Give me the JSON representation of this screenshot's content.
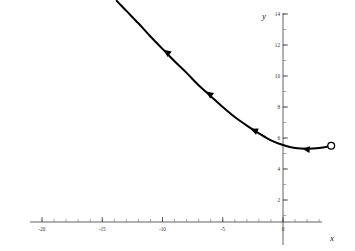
{
  "figure": {
    "background_color": "#ffffff",
    "curve_color": "#000000",
    "axis_color": "#3a3a3a",
    "width": 355,
    "height": 251
  },
  "axes": {
    "x_axis_label": "x",
    "y_axis_label": "y",
    "x_ticks": [
      {
        "value": -20,
        "label": "-20"
      },
      {
        "value": -15,
        "label": "-15"
      },
      {
        "value": -10,
        "label": "-10"
      },
      {
        "value": -5,
        "label": "-5"
      },
      {
        "value": 0,
        "label": "0"
      }
    ],
    "y_ticks": [
      {
        "value": 14,
        "label": "14"
      },
      {
        "value": 12,
        "label": "12"
      },
      {
        "value": 10,
        "label": "10"
      },
      {
        "value": 8,
        "label": "8"
      },
      {
        "value": 6,
        "label": "6"
      },
      {
        "value": 4,
        "label": "4"
      },
      {
        "value": 2,
        "label": "2"
      }
    ],
    "x_minor_step": 1,
    "y_minor_step": 1
  },
  "chart_data": {
    "type": "line",
    "title": "",
    "subtitle": "",
    "xlabel": "x",
    "ylabel": "y",
    "xlim": [
      -23.5,
      6
    ],
    "ylim": [
      0,
      15.3
    ],
    "grid": false,
    "legend": null,
    "series": [
      {
        "name": "solution curve",
        "color": "#000000",
        "x": [
          -13.8,
          -13.0,
          -12.0,
          -11.0,
          -10.0,
          -9.0,
          -8.0,
          -7.0,
          -6.0,
          -5.0,
          -4.0,
          -3.0,
          -2.0,
          -1.0,
          0.0,
          1.0,
          2.0,
          3.0,
          4.0
        ],
        "y": [
          14.85,
          14.2,
          13.4,
          12.55,
          11.75,
          10.95,
          10.2,
          9.4,
          8.7,
          8.0,
          7.35,
          6.8,
          6.3,
          5.85,
          5.55,
          5.35,
          5.3,
          5.35,
          5.5
        ]
      }
    ],
    "direction_arrows": [
      {
        "x": -9.9,
        "y": 11.7,
        "angle_deg": 218,
        "note": "flow arrow pointing left-up along curve"
      },
      {
        "x": -6.4,
        "y": 9.0,
        "angle_deg": 214,
        "note": "flow arrow pointing left-up along curve"
      },
      {
        "x": -2.7,
        "y": 6.6,
        "angle_deg": 203,
        "note": "flow arrow pointing left-up along curve"
      },
      {
        "x": 1.6,
        "y": 5.3,
        "angle_deg": 186,
        "note": "flow arrow pointing left along curve"
      }
    ],
    "endpoints": [
      {
        "x": 4.0,
        "y": 5.5,
        "style": "open-circle",
        "note": "open circle terminal point at right end of curve"
      }
    ]
  }
}
